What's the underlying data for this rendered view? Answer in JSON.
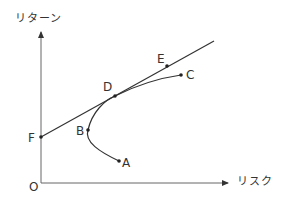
{
  "axes": {
    "y_label": "リターン",
    "x_label": "リスク",
    "origin_label": "O"
  },
  "points": {
    "A": {
      "label": "A",
      "x": 119,
      "y": 161
    },
    "B": {
      "label": "B",
      "x": 88,
      "y": 130
    },
    "C": {
      "label": "C",
      "x": 181,
      "y": 75
    },
    "D": {
      "label": "D",
      "x": 115,
      "y": 96
    },
    "E": {
      "label": "E",
      "x": 167,
      "y": 66
    },
    "F": {
      "label": "F",
      "x": 41,
      "y": 137
    }
  },
  "colors": {
    "line": "#333333",
    "axis": "#555555",
    "text": "#333333"
  }
}
